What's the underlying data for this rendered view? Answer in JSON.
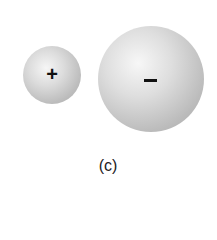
{
  "figure": {
    "caption": "(c)",
    "spheres": [
      {
        "label": "small positive sphere",
        "sign": "+",
        "color": "#cfcfcf"
      },
      {
        "label": "large negative sphere",
        "sign": "−",
        "color": "#c6c6c6"
      }
    ]
  }
}
